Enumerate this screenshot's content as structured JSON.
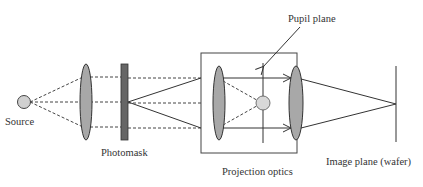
{
  "diagram": {
    "type": "optical lithography system schematic",
    "labels": {
      "source": "Source",
      "photomask": "Photomask",
      "projection_optics": "Projection optics",
      "pupil_plane": "Pupil plane",
      "image_plane": "Image plane (wafer)"
    },
    "colors": {
      "lens_fill": "#a8a8a8",
      "mask_fill": "#666666",
      "source_fill": "#d0d0d0",
      "stroke": "#333333"
    },
    "components": [
      {
        "id": "source",
        "label": "Source",
        "shape": "circle"
      },
      {
        "id": "condenser-lens",
        "shape": "ellipse"
      },
      {
        "id": "photomask",
        "label": "Photomask",
        "shape": "bar"
      },
      {
        "id": "projection-optics",
        "label": "Projection optics",
        "shape": "box",
        "contains": [
          "projection-lens-1",
          "pupil-aperture",
          "projection-lens-2"
        ]
      },
      {
        "id": "pupil-plane",
        "label": "Pupil plane",
        "shape": "line"
      },
      {
        "id": "image-plane",
        "label": "Image plane (wafer)",
        "shape": "line"
      }
    ]
  }
}
